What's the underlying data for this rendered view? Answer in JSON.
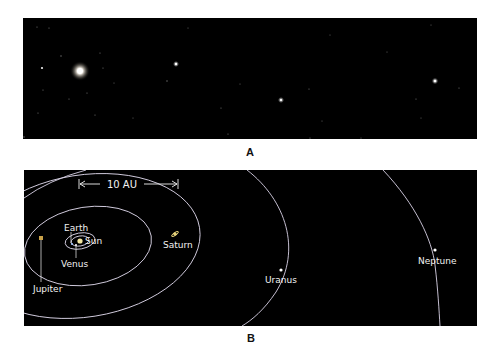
{
  "figure": {
    "panel_a": {
      "label": "A",
      "description": "Star field photograph with a bright fuzzy object (upper left)",
      "background": "#000000",
      "bright_object": {
        "x": 57,
        "y": 53,
        "radius": 7
      },
      "bright_stars": [
        {
          "x": 153,
          "y": 46,
          "r": 1.6
        },
        {
          "x": 258,
          "y": 82,
          "r": 1.5
        },
        {
          "x": 412,
          "y": 63,
          "r": 1.7
        },
        {
          "x": 19,
          "y": 50,
          "r": 1.3
        }
      ]
    },
    "panel_b": {
      "label": "B",
      "background": "#000000",
      "orbit_color": "#d9d3e6",
      "scale_bar": {
        "label": "10 AU"
      },
      "planets": [
        {
          "name": "Sun",
          "label": "Sun",
          "color": "#f2e6a0"
        },
        {
          "name": "Venus",
          "label": "Venus",
          "color": "#ffffff"
        },
        {
          "name": "Earth",
          "label": "Earth",
          "color": "#9fc3ff"
        },
        {
          "name": "Jupiter",
          "label": "Jupiter",
          "color": "#c9a24a"
        },
        {
          "name": "Saturn",
          "label": "Saturn",
          "color": "#e6d27a"
        },
        {
          "name": "Uranus",
          "label": "Uranus",
          "color": "#ffffff"
        },
        {
          "name": "Neptune",
          "label": "Neptune",
          "color": "#ffffff"
        }
      ]
    }
  }
}
